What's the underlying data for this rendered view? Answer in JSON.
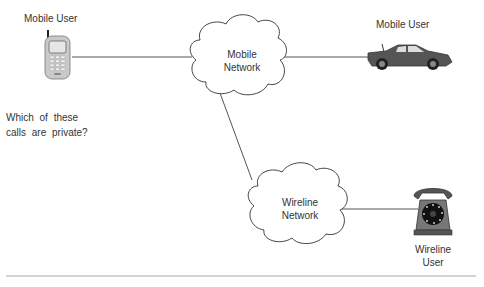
{
  "nodes": {
    "mobile_user_phone": {
      "label": "Mobile  User",
      "icon": "cell-phone-icon"
    },
    "mobile_user_car": {
      "label": "Mobile  User",
      "icon": "car-icon"
    },
    "mobile_network": {
      "line1": "Mobile",
      "line2": "Network",
      "shape": "cloud"
    },
    "wireline_network": {
      "line1": "Wireline",
      "line2": "Network",
      "shape": "cloud"
    },
    "wireline_user": {
      "line1": "Wireline",
      "line2": "User",
      "icon": "telephone-icon"
    }
  },
  "question": {
    "line1": "Which  of  these",
    "line2": "calls  are  private?"
  },
  "edges": [
    {
      "from": "mobile_user_phone",
      "to": "mobile_network"
    },
    {
      "from": "mobile_network",
      "to": "mobile_user_car"
    },
    {
      "from": "mobile_network",
      "to": "wireline_network"
    },
    {
      "from": "wireline_network",
      "to": "wireline_user"
    }
  ]
}
